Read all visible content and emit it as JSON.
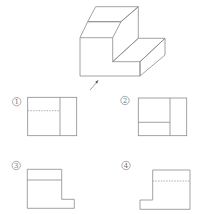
{
  "figure": {
    "type": "orthographic-projection-question",
    "colors": {
      "line": "#8a8a8a",
      "hidden_line": "#9a9a9a",
      "label": "#777777",
      "background": "#ffffff"
    },
    "view_arrow": {
      "label": ""
    },
    "options": [
      {
        "id": "1",
        "label": "①",
        "glyph": "1",
        "shape": "rectangle",
        "divider": "vertical",
        "extra_line": "dashed-horizontal"
      },
      {
        "id": "2",
        "label": "②",
        "glyph": "2",
        "shape": "rectangle",
        "divider": "vertical",
        "extra_line": "solid-horizontal"
      },
      {
        "id": "3",
        "label": "③",
        "glyph": "3",
        "shape": "L-step-right",
        "extra_line": "solid-horizontal"
      },
      {
        "id": "4",
        "label": "④",
        "glyph": "4",
        "shape": "L-step-left",
        "extra_line": "dashed-horizontal"
      }
    ]
  }
}
